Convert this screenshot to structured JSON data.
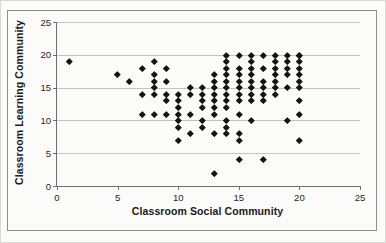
{
  "figure": {
    "background": "#fbfbf9",
    "frame_border_color": "#8f8f8f",
    "gridline_color": "#c3c3c0",
    "axis_color": "#6e6e6e",
    "marker_color": "#141414"
  },
  "chart_data": {
    "type": "scatter",
    "title": "",
    "xlabel": "Classroom Social Community",
    "ylabel": "Classroom Learning Community",
    "xlim": [
      0,
      25
    ],
    "ylim": [
      0,
      25
    ],
    "x_ticks": [
      0,
      5,
      10,
      15,
      20,
      25
    ],
    "y_ticks": [
      0,
      5,
      10,
      15,
      20,
      25
    ],
    "grid": "horizontal-only",
    "legend": "none",
    "marker": "diamond",
    "points": [
      [
        1,
        19
      ],
      [
        5,
        17
      ],
      [
        6,
        16
      ],
      [
        7,
        18
      ],
      [
        7,
        14
      ],
      [
        7,
        11
      ],
      [
        8,
        19
      ],
      [
        8,
        17
      ],
      [
        8,
        16
      ],
      [
        8,
        15
      ],
      [
        8,
        14
      ],
      [
        8,
        11
      ],
      [
        9,
        18
      ],
      [
        9,
        16
      ],
      [
        9,
        14
      ],
      [
        9,
        13
      ],
      [
        9,
        11
      ],
      [
        10,
        14
      ],
      [
        10,
        13
      ],
      [
        10,
        12
      ],
      [
        10,
        11
      ],
      [
        10,
        10
      ],
      [
        10,
        9
      ],
      [
        10,
        7
      ],
      [
        11,
        15
      ],
      [
        11,
        14
      ],
      [
        11,
        11
      ],
      [
        11,
        8
      ],
      [
        12,
        15
      ],
      [
        12,
        14
      ],
      [
        12,
        13
      ],
      [
        12,
        12
      ],
      [
        12,
        10
      ],
      [
        12,
        9
      ],
      [
        13,
        17
      ],
      [
        13,
        16
      ],
      [
        13,
        15
      ],
      [
        13,
        14
      ],
      [
        13,
        13
      ],
      [
        13,
        12
      ],
      [
        13,
        11
      ],
      [
        13,
        8
      ],
      [
        13,
        2
      ],
      [
        14,
        20
      ],
      [
        14,
        19
      ],
      [
        14,
        18
      ],
      [
        14,
        17
      ],
      [
        14,
        16
      ],
      [
        14,
        15
      ],
      [
        14,
        14
      ],
      [
        14,
        13
      ],
      [
        14,
        12
      ],
      [
        14,
        10
      ],
      [
        14,
        9
      ],
      [
        14,
        8
      ],
      [
        15,
        20
      ],
      [
        15,
        18
      ],
      [
        15,
        17
      ],
      [
        15,
        16
      ],
      [
        15,
        15
      ],
      [
        15,
        14
      ],
      [
        15,
        13
      ],
      [
        15,
        11
      ],
      [
        15,
        8
      ],
      [
        15,
        7
      ],
      [
        15,
        4
      ],
      [
        16,
        20
      ],
      [
        16,
        19
      ],
      [
        16,
        18
      ],
      [
        16,
        17
      ],
      [
        16,
        16
      ],
      [
        16,
        15
      ],
      [
        16,
        14
      ],
      [
        16,
        13
      ],
      [
        16,
        10
      ],
      [
        17,
        20
      ],
      [
        17,
        18
      ],
      [
        17,
        16
      ],
      [
        17,
        15
      ],
      [
        17,
        14
      ],
      [
        17,
        13
      ],
      [
        17,
        4
      ],
      [
        18,
        20
      ],
      [
        18,
        19
      ],
      [
        18,
        18
      ],
      [
        18,
        17
      ],
      [
        18,
        16
      ],
      [
        18,
        15
      ],
      [
        18,
        14
      ],
      [
        19,
        20
      ],
      [
        19,
        19
      ],
      [
        19,
        18
      ],
      [
        19,
        17
      ],
      [
        19,
        15
      ],
      [
        19,
        10
      ],
      [
        20,
        20
      ],
      [
        20,
        20
      ],
      [
        20,
        19
      ],
      [
        20,
        18
      ],
      [
        20,
        17
      ],
      [
        20,
        16
      ],
      [
        20,
        15
      ],
      [
        20,
        13
      ],
      [
        20,
        11
      ],
      [
        20,
        7
      ]
    ]
  }
}
